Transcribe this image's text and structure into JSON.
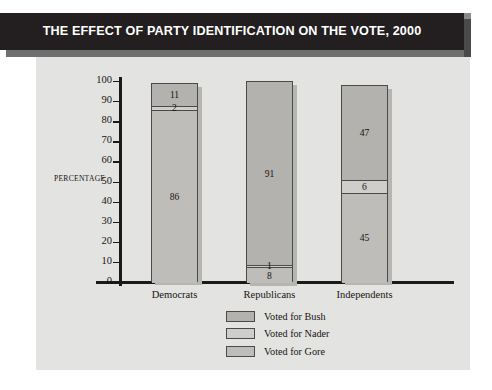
{
  "title": "THE EFFECT OF PARTY IDENTIFICATION ON THE VOTE, 2000",
  "axis": {
    "y_title": "PERCENTAGE",
    "ticks": [
      "100",
      "90",
      "80",
      "70",
      "60",
      "50",
      "40",
      "30",
      "20",
      "10",
      "0"
    ]
  },
  "legend": {
    "items": [
      {
        "label": "Voted for Bush",
        "color": "#b3b2af"
      },
      {
        "label": "Voted for Nader",
        "color": "#cfcecb"
      },
      {
        "label": "Voted for Gore",
        "color": "#bebdba"
      }
    ]
  },
  "colors": {
    "panel_background": "#e3e3e1",
    "title_bar": "#231f20",
    "title_text": "#ffffff",
    "axis": "#1a1a1a",
    "bar_outline": "#4a4a4a",
    "bar_shadow": "#b6b5b2"
  },
  "chart_data": {
    "type": "bar",
    "title": "THE EFFECT OF PARTY IDENTIFICATION ON THE VOTE, 2000",
    "subtitle": "",
    "xlabel": "",
    "ylabel": "PERCENTAGE",
    "ylim": [
      0,
      100
    ],
    "ytick_interval": 10,
    "grid": false,
    "stacked": true,
    "legend_position": "bottom-center",
    "categories": [
      "Democrats",
      "Republicans",
      "Independents"
    ],
    "series": [
      {
        "name": "Voted for Bush",
        "values": [
          11,
          91,
          47
        ]
      },
      {
        "name": "Voted for Nader",
        "values": [
          2,
          1,
          6
        ]
      },
      {
        "name": "Voted for Gore",
        "values": [
          86,
          8,
          45
        ]
      }
    ],
    "totals": [
      99,
      100,
      98
    ],
    "stack_order_bottom_to_top": [
      "Voted for Gore",
      "Voted for Nader",
      "Voted for Bush"
    ]
  },
  "bars": [
    {
      "category": "Democrats",
      "segments": [
        {
          "name": "Voted for Bush",
          "value": 11,
          "label": "11"
        },
        {
          "name": "Voted for Nader",
          "value": 2,
          "label": "2"
        },
        {
          "name": "Voted for Gore",
          "value": 86,
          "label": "86"
        }
      ]
    },
    {
      "category": "Republicans",
      "segments": [
        {
          "name": "Voted for Bush",
          "value": 91,
          "label": "91"
        },
        {
          "name": "Voted for Nader",
          "value": 1,
          "label": "1"
        },
        {
          "name": "Voted for Gore",
          "value": 8,
          "label": "8"
        }
      ]
    },
    {
      "category": "Independents",
      "segments": [
        {
          "name": "Voted for Bush",
          "value": 47,
          "label": "47"
        },
        {
          "name": "Voted for Nader",
          "value": 6,
          "label": "6"
        },
        {
          "name": "Voted for Gore",
          "value": 45,
          "label": "45"
        }
      ]
    }
  ]
}
